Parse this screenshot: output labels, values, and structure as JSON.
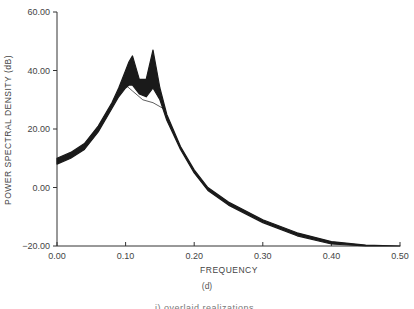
{
  "chart_data": {
    "type": "line",
    "title": "",
    "subfigure_label": "(d)",
    "caption_partial": "i) overlaid realizations",
    "xlabel": "FREQUENCY",
    "ylabel": "POWER SPECTRAL DENSITY (dB)",
    "xlim": [
      0.0,
      0.5
    ],
    "ylim": [
      -20,
      60
    ],
    "xticks": [
      "0.00",
      "0.10",
      "0.20",
      "0.30",
      "0.40",
      "0.50"
    ],
    "yticks": [
      "-20.00",
      "0.00",
      "20.00",
      "40.00",
      "60.00"
    ],
    "grid": false,
    "legend": null,
    "line_color": "#1a1a1a",
    "series": [
      {
        "name": "realizations-band-upper",
        "x": [
          0.0,
          0.02,
          0.04,
          0.06,
          0.08,
          0.09,
          0.1,
          0.105,
          0.11,
          0.12,
          0.13,
          0.14,
          0.15,
          0.16,
          0.18,
          0.2,
          0.22,
          0.25,
          0.3,
          0.35,
          0.4,
          0.45,
          0.5
        ],
        "values": [
          10,
          12,
          15,
          21,
          29,
          34,
          40,
          43,
          45,
          37,
          37,
          47,
          34,
          25,
          14,
          6,
          0,
          -5,
          -11,
          -15.5,
          -18.5,
          -19.7,
          -20
        ]
      },
      {
        "name": "realizations-band-lower",
        "x": [
          0.0,
          0.02,
          0.04,
          0.06,
          0.08,
          0.09,
          0.1,
          0.105,
          0.11,
          0.12,
          0.13,
          0.14,
          0.15,
          0.16,
          0.18,
          0.2,
          0.22,
          0.25,
          0.3,
          0.35,
          0.4,
          0.45,
          0.5
        ],
        "values": [
          8,
          10,
          13,
          19,
          27,
          31,
          34,
          35,
          35,
          32,
          31,
          34,
          30,
          23,
          13,
          5,
          -1,
          -6,
          -12,
          -16.5,
          -19.3,
          -20,
          -20
        ]
      }
    ]
  }
}
